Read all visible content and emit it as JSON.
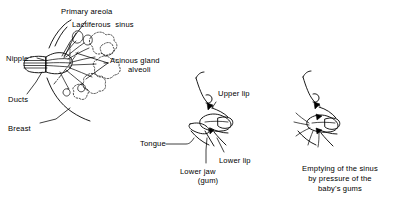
{
  "figure": {
    "kind": "anatomical-line-drawing",
    "ink_color": "#000000",
    "background_color": "#ffffff",
    "panels": [
      {
        "id": "breast-anatomy",
        "labels": {
          "primary_areola": "Primary areola",
          "lactiferous_sinus": "Lactiferous  sinus",
          "nipple": "Nipple",
          "acinous_gland": "Acinous gland",
          "alveoli": "alveoli",
          "ducts": "Ducts",
          "breast": "Breast"
        }
      },
      {
        "id": "infant-latch",
        "labels": {
          "upper_lip": "Upper lip",
          "tongue": "Tongue",
          "lower_lip": "Lower lip",
          "lower_jaw": "Lower jaw",
          "lower_jaw_gum": "(gum)"
        }
      },
      {
        "id": "sinus-emptying",
        "caption_line1": "Emptying of the sinus",
        "caption_line2": "by pressure of the",
        "caption_line3": "baby's gums"
      }
    ]
  }
}
